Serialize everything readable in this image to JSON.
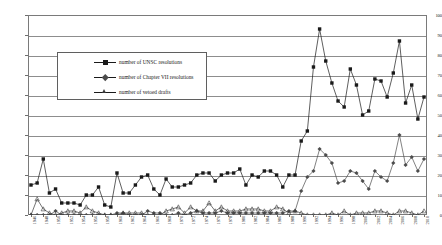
{
  "chart_data": {
    "type": "line",
    "title": "",
    "subtitle": "",
    "xlabel": "",
    "ylabel": "",
    "ylim": [
      0,
      100
    ],
    "ytick_step": 10,
    "yticks": [
      0,
      10,
      20,
      30,
      40,
      50,
      60,
      70,
      80,
      90,
      100
    ],
    "grid": true,
    "grid_axis": "y",
    "legend_position": "upper-left-center",
    "xlabel_rotation": -90,
    "xtick_interval_years": 2,
    "x": [
      1946,
      1947,
      1948,
      1949,
      1950,
      1951,
      1952,
      1953,
      1954,
      1955,
      1956,
      1957,
      1958,
      1959,
      1960,
      1961,
      1962,
      1963,
      1964,
      1965,
      1966,
      1967,
      1968,
      1969,
      1970,
      1971,
      1972,
      1973,
      1974,
      1975,
      1976,
      1977,
      1978,
      1979,
      1980,
      1981,
      1982,
      1983,
      1984,
      1985,
      1986,
      1987,
      1988,
      1989,
      1990,
      1991,
      1992,
      1993,
      1994,
      1995,
      1996,
      1997,
      1998,
      1999,
      2000,
      2001,
      2002,
      2003,
      2004,
      2005,
      2006,
      2007,
      2008,
      2009,
      2010
    ],
    "xtick_labels": [
      "1946",
      "1948",
      "1950",
      "1952",
      "1954",
      "1956",
      "1958",
      "1960",
      "1962",
      "1964",
      "1966",
      "1968",
      "1970",
      "1972",
      "1974",
      "1976",
      "1978",
      "1980",
      "1982",
      "1984",
      "1986",
      "1988",
      "1990",
      "1992",
      "1994",
      "1996",
      "1998",
      "2000",
      "2002",
      "2004",
      "2006",
      "2008",
      "2010"
    ],
    "series": [
      {
        "name": "number of UNSC resolutions",
        "marker": "square",
        "color": "#1a1a1a",
        "values": [
          15,
          16,
          28,
          11,
          13,
          6,
          6,
          6,
          5,
          10,
          10,
          14,
          5,
          4,
          21,
          11,
          11,
          15,
          19,
          20,
          13,
          10,
          18,
          14,
          14,
          15,
          16,
          20,
          21,
          21,
          17,
          20,
          21,
          21,
          23,
          15,
          20,
          19,
          22,
          22,
          20,
          14,
          20,
          20,
          37,
          42,
          74,
          93,
          77,
          66,
          57,
          54,
          73,
          65,
          50,
          52,
          68,
          67,
          59,
          71,
          87,
          56,
          65,
          48,
          59
        ]
      },
      {
        "name": "number of Chapter VII resolutions",
        "marker": "diamond",
        "color": "#4c4c4c",
        "values": [
          0,
          0,
          0,
          0,
          2,
          0,
          0,
          0,
          0,
          0,
          0,
          0,
          0,
          0,
          1,
          1,
          0,
          0,
          0,
          2,
          1,
          1,
          0,
          0,
          1,
          0,
          1,
          2,
          1,
          1,
          1,
          2,
          1,
          1,
          1,
          1,
          1,
          1,
          1,
          1,
          1,
          1,
          2,
          2,
          12,
          19,
          22,
          33,
          30,
          26,
          16,
          17,
          22,
          21,
          17,
          13,
          22,
          19,
          17,
          26,
          40,
          25,
          29,
          22,
          28
        ]
      },
      {
        "name": "number of vetoed drafts",
        "marker": "triangle",
        "color": "#3a3a3a",
        "values": [
          0,
          8,
          3,
          1,
          0,
          1,
          2,
          2,
          1,
          4,
          2,
          1,
          0,
          0,
          0,
          1,
          1,
          1,
          1,
          0,
          0,
          0,
          2,
          3,
          4,
          1,
          4,
          2,
          2,
          6,
          2,
          4,
          2,
          2,
          2,
          3,
          3,
          3,
          2,
          2,
          4,
          3,
          1,
          2,
          1,
          0,
          0,
          0,
          0,
          1,
          0,
          2,
          0,
          1,
          1,
          1,
          2,
          2,
          1,
          0,
          2,
          2,
          1,
          0,
          2
        ]
      }
    ]
  },
  "legend": {
    "items": [
      {
        "label": "number of UNSC resolutions"
      },
      {
        "label": "number of Chapter VII resolutions"
      },
      {
        "label": "number of vetoed drafts"
      }
    ]
  }
}
